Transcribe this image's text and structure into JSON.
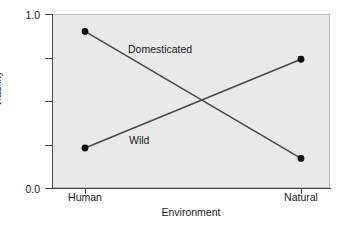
{
  "chart_data": {
    "type": "line",
    "title": "",
    "subtitle": "",
    "xlabel": "Environment",
    "ylabel": "Viability",
    "categories": [
      "Human",
      "Natural"
    ],
    "x_tick_labels": [
      "Human",
      "Natural"
    ],
    "y_tick_labels": [
      "1.0",
      "0.0"
    ],
    "y_tick_values": [
      1.0,
      0.0
    ],
    "y_minor_tick_values": [
      0.75,
      0.5,
      0.25
    ],
    "ylim": [
      0.0,
      1.0
    ],
    "grid": false,
    "legend": "inline-annotations",
    "legend_position": "inline",
    "markers": "filled-circle",
    "series": [
      {
        "name": "Domesticated",
        "values": [
          0.9,
          0.17
        ],
        "points": [
          {
            "x": "Human",
            "y": 0.9
          },
          {
            "x": "Natural",
            "y": 0.17
          }
        ]
      },
      {
        "name": "Wild",
        "values": [
          0.23,
          0.74
        ],
        "points": [
          {
            "x": "Human",
            "y": 0.23
          },
          {
            "x": "Natural",
            "y": 0.74
          }
        ]
      }
    ],
    "annotations": [
      {
        "text": "Domesticated",
        "series": "Domesticated"
      },
      {
        "text": "Wild",
        "series": "Wild"
      }
    ],
    "colors": {
      "plot_background": "#e9e9e9",
      "page_background": "#ffffff",
      "line": "#4a4a4a",
      "marker": "#111111",
      "axis": "#4a4a4a",
      "text": "#1a1a1a"
    }
  },
  "axes": {
    "y": {
      "title": "Viability",
      "tick_top": "1.0",
      "tick_bottom": "0.0"
    },
    "x": {
      "title": "Environment",
      "tick_left": "Human",
      "tick_right": "Natural"
    }
  },
  "series_labels": {
    "domesticated": "Domesticated",
    "wild": "Wild"
  }
}
